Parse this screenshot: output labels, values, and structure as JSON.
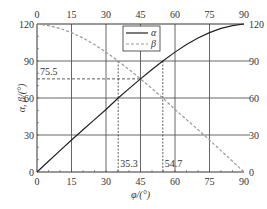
{
  "chart_data": {
    "type": "line",
    "title": "",
    "xlabel": "φ/(°)",
    "ylabel": "α, β/(°)",
    "xlim": [
      0,
      90
    ],
    "ylim": [
      0,
      120
    ],
    "x_ticks": [
      0,
      15,
      30,
      45,
      60,
      75,
      90
    ],
    "y_ticks": [
      0,
      30,
      60,
      90,
      120
    ],
    "top_axis_ticks": [
      0,
      15,
      30,
      45,
      60,
      75,
      90
    ],
    "right_axis_ticks": [
      0,
      30,
      60,
      90,
      120
    ],
    "grid": true,
    "legend": {
      "position": "top-center",
      "entries": [
        {
          "label": "α",
          "style": "solid",
          "color": "#222222"
        },
        {
          "label": "β",
          "style": "dashed",
          "color": "#999999"
        }
      ]
    },
    "series": [
      {
        "name": "α",
        "x": [
          0,
          5,
          10,
          15,
          20,
          25,
          30,
          35.3,
          40,
          45,
          50,
          54.7,
          60,
          65,
          70,
          75,
          80,
          85,
          90
        ],
        "values": [
          0,
          8.7,
          17.3,
          25.9,
          34.3,
          42.5,
          50.7,
          60,
          67.6,
          75.5,
          83.1,
          90,
          97.2,
          103.3,
          108.6,
          113.0,
          116.4,
          118.7,
          120
        ]
      },
      {
        "name": "β",
        "x": [
          0,
          5,
          10,
          15,
          20,
          25,
          30,
          35.3,
          40,
          45,
          50,
          54.7,
          60,
          65,
          70,
          75,
          80,
          85,
          90
        ],
        "values": [
          120,
          118.7,
          116.4,
          113.0,
          108.6,
          103.3,
          97.2,
          90,
          83.1,
          75.5,
          67.6,
          60,
          50.7,
          42.5,
          34.3,
          25.9,
          17.3,
          8.7,
          0
        ]
      }
    ],
    "annotations": [
      {
        "text": "75.5",
        "type": "hline",
        "y": 75.5,
        "x_to": 45
      },
      {
        "text": "35.3",
        "type": "vline",
        "x": 35.3,
        "y_to": 90
      },
      {
        "text": "54.7",
        "type": "vline",
        "x": 54.7,
        "y_to": 90
      }
    ]
  }
}
